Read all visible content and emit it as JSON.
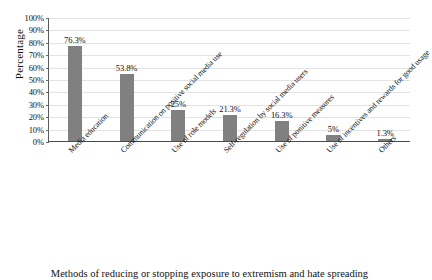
{
  "chart_data": {
    "type": "bar",
    "title": "",
    "xlabel": "Methods of reducing or stopping exposure to extremism and hate spreading",
    "ylabel": "Percentage",
    "ylim": [
      0,
      100
    ],
    "grid": true,
    "legend": "none",
    "categories": [
      "Media education",
      "Communication on positive social media use",
      "Use of role models",
      "Self-regulation by social media users",
      "Use of punitive measures",
      "Use of incentives and rewards for good usage",
      "Others"
    ],
    "values": [
      76.3,
      53.8,
      25,
      21.3,
      16.3,
      5,
      1.3
    ],
    "data_labels": [
      "76.3%",
      "53.8%",
      "25%",
      "21.3%",
      "16.3%",
      "5%",
      "1.3%"
    ],
    "y_ticks": [
      0,
      10,
      20,
      30,
      40,
      50,
      60,
      70,
      80,
      90,
      100
    ],
    "y_tick_labels": [
      "0%",
      "10%",
      "20%",
      "30%",
      "40%",
      "50%",
      "60%",
      "70%",
      "80%",
      "90%",
      "100%"
    ],
    "bar_color": "#808080",
    "gridline_color": "#e3e3e3",
    "axis_color": "#4a4a4a",
    "background": "#ffffff"
  }
}
